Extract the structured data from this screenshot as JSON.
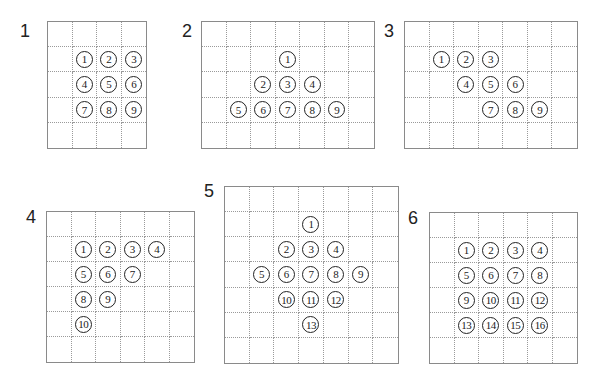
{
  "panels": [
    {
      "label": "1",
      "label_pos": [
        20,
        32
      ],
      "grid": {
        "x": 47,
        "y": 21,
        "w": 100,
        "h": 128,
        "cols": 4,
        "rows": 5
      },
      "tokens": [
        {
          "n": "1",
          "r": 1,
          "c": 1
        },
        {
          "n": "2",
          "r": 1,
          "c": 2
        },
        {
          "n": "3",
          "r": 1,
          "c": 3
        },
        {
          "n": "4",
          "r": 2,
          "c": 1
        },
        {
          "n": "5",
          "r": 2,
          "c": 2
        },
        {
          "n": "6",
          "r": 2,
          "c": 3
        },
        {
          "n": "7",
          "r": 3,
          "c": 1
        },
        {
          "n": "8",
          "r": 3,
          "c": 2
        },
        {
          "n": "9",
          "r": 3,
          "c": 3
        }
      ]
    },
    {
      "label": "2",
      "label_pos": [
        182,
        32
      ],
      "grid": {
        "x": 201,
        "y": 21,
        "w": 174,
        "h": 128,
        "cols": 7,
        "rows": 5
      },
      "tokens": [
        {
          "n": "1",
          "r": 1,
          "c": 3
        },
        {
          "n": "2",
          "r": 2,
          "c": 2
        },
        {
          "n": "3",
          "r": 2,
          "c": 3
        },
        {
          "n": "4",
          "r": 2,
          "c": 4
        },
        {
          "n": "5",
          "r": 3,
          "c": 1
        },
        {
          "n": "6",
          "r": 3,
          "c": 2
        },
        {
          "n": "7",
          "r": 3,
          "c": 3
        },
        {
          "n": "8",
          "r": 3,
          "c": 4
        },
        {
          "n": "9",
          "r": 3,
          "c": 5
        }
      ]
    },
    {
      "label": "3",
      "label_pos": [
        384,
        32
      ],
      "grid": {
        "x": 404,
        "y": 21,
        "w": 174,
        "h": 128,
        "cols": 7,
        "rows": 5
      },
      "tokens": [
        {
          "n": "1",
          "r": 1,
          "c": 1
        },
        {
          "n": "2",
          "r": 1,
          "c": 2
        },
        {
          "n": "3",
          "r": 1,
          "c": 3
        },
        {
          "n": "4",
          "r": 2,
          "c": 2
        },
        {
          "n": "5",
          "r": 2,
          "c": 3
        },
        {
          "n": "6",
          "r": 2,
          "c": 4
        },
        {
          "n": "7",
          "r": 3,
          "c": 3
        },
        {
          "n": "8",
          "r": 3,
          "c": 4
        },
        {
          "n": "9",
          "r": 3,
          "c": 5
        }
      ]
    },
    {
      "label": "4",
      "label_pos": [
        26,
        218
      ],
      "grid": {
        "x": 46,
        "y": 211,
        "w": 149,
        "h": 152,
        "cols": 6,
        "rows": 6
      },
      "tokens": [
        {
          "n": "1",
          "r": 1,
          "c": 1
        },
        {
          "n": "2",
          "r": 1,
          "c": 2
        },
        {
          "n": "3",
          "r": 1,
          "c": 3
        },
        {
          "n": "4",
          "r": 1,
          "c": 4
        },
        {
          "n": "5",
          "r": 2,
          "c": 1
        },
        {
          "n": "6",
          "r": 2,
          "c": 2
        },
        {
          "n": "7",
          "r": 2,
          "c": 3
        },
        {
          "n": "8",
          "r": 3,
          "c": 1
        },
        {
          "n": "9",
          "r": 3,
          "c": 2
        },
        {
          "n": "10",
          "r": 4,
          "c": 1
        }
      ]
    },
    {
      "label": "5",
      "label_pos": [
        204,
        192
      ],
      "grid": {
        "x": 224,
        "y": 186,
        "w": 175,
        "h": 178,
        "cols": 7,
        "rows": 7
      },
      "tokens": [
        {
          "n": "1",
          "r": 1,
          "c": 3
        },
        {
          "n": "2",
          "r": 2,
          "c": 2
        },
        {
          "n": "3",
          "r": 2,
          "c": 3
        },
        {
          "n": "4",
          "r": 2,
          "c": 4
        },
        {
          "n": "5",
          "r": 3,
          "c": 1
        },
        {
          "n": "6",
          "r": 3,
          "c": 2
        },
        {
          "n": "7",
          "r": 3,
          "c": 3
        },
        {
          "n": "8",
          "r": 3,
          "c": 4
        },
        {
          "n": "9",
          "r": 3,
          "c": 5
        },
        {
          "n": "10",
          "r": 4,
          "c": 2
        },
        {
          "n": "11",
          "r": 4,
          "c": 3
        },
        {
          "n": "12",
          "r": 4,
          "c": 4
        },
        {
          "n": "13",
          "r": 5,
          "c": 3
        }
      ]
    },
    {
      "label": "6",
      "label_pos": [
        408,
        219
      ],
      "grid": {
        "x": 429,
        "y": 212,
        "w": 149,
        "h": 152,
        "cols": 6,
        "rows": 6
      },
      "tokens": [
        {
          "n": "1",
          "r": 1,
          "c": 1
        },
        {
          "n": "2",
          "r": 1,
          "c": 2
        },
        {
          "n": "3",
          "r": 1,
          "c": 3
        },
        {
          "n": "4",
          "r": 1,
          "c": 4
        },
        {
          "n": "5",
          "r": 2,
          "c": 1
        },
        {
          "n": "6",
          "r": 2,
          "c": 2
        },
        {
          "n": "7",
          "r": 2,
          "c": 3
        },
        {
          "n": "8",
          "r": 2,
          "c": 4
        },
        {
          "n": "9",
          "r": 3,
          "c": 1
        },
        {
          "n": "10",
          "r": 3,
          "c": 2
        },
        {
          "n": "11",
          "r": 3,
          "c": 3
        },
        {
          "n": "12",
          "r": 3,
          "c": 4
        },
        {
          "n": "13",
          "r": 4,
          "c": 1
        },
        {
          "n": "14",
          "r": 4,
          "c": 2
        },
        {
          "n": "15",
          "r": 4,
          "c": 3
        },
        {
          "n": "16",
          "r": 4,
          "c": 4
        }
      ]
    }
  ]
}
